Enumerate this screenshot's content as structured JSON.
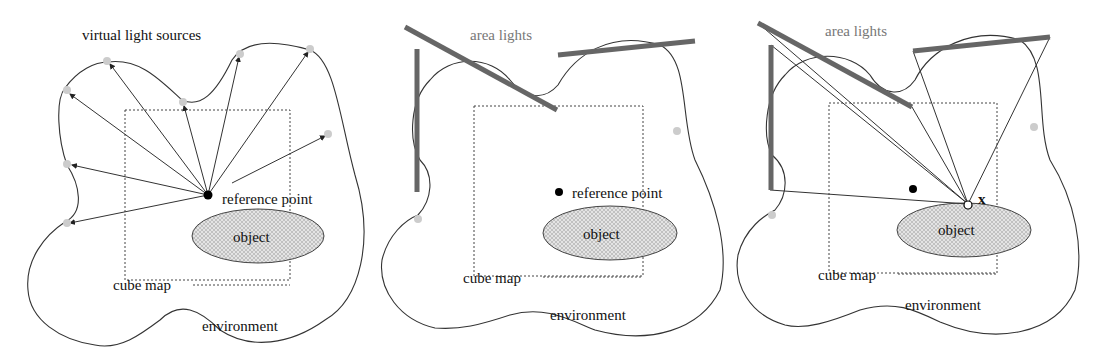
{
  "figure": {
    "panels": [
      {
        "id": "virtual-light-sources",
        "title": "virtual light sources",
        "labels": {
          "reference_point": "reference point",
          "object": "object",
          "cube_map": "cube map",
          "environment": "environment"
        }
      },
      {
        "id": "area-lights",
        "title": "area lights",
        "labels": {
          "reference_point": "reference point",
          "object": "object",
          "cube_map": "cube map",
          "environment": "environment"
        }
      },
      {
        "id": "area-lights-shading-point",
        "title": "area lights",
        "labels": {
          "point_x": "x",
          "object": "object",
          "cube_map": "cube map",
          "environment": "environment"
        }
      }
    ],
    "colors": {
      "line": "#333333",
      "area_light": "#666666",
      "vls": "#cccccc",
      "object_fill": "#d8d8d8"
    }
  }
}
